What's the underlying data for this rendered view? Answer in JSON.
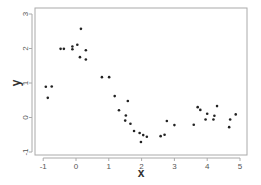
{
  "chart_data": {
    "type": "scatter",
    "title": "",
    "xlabel": "x",
    "ylabel": "y",
    "xlim": [
      -1.25,
      5.2
    ],
    "ylim": [
      -1.1,
      3.15
    ],
    "xticks": [
      -1,
      0,
      1,
      2,
      3,
      4,
      5
    ],
    "yticks": [
      -1,
      0,
      1,
      2,
      3
    ],
    "grid": false,
    "legend": null,
    "point_color": "#222222",
    "axis_color": "#aaaaaa",
    "series": [
      {
        "name": "points",
        "x": [
          -0.92,
          -0.74,
          -0.86,
          -0.47,
          -0.37,
          -0.11,
          -0.11,
          0.04,
          0.15,
          0.12,
          0.3,
          0.3,
          0.79,
          1.01,
          1.18,
          1.58,
          1.31,
          1.52,
          1.5,
          1.66,
          1.77,
          1.94,
          2.05,
          2.16,
          1.98,
          2.58,
          2.7,
          2.77,
          3.0,
          3.59,
          3.71,
          3.79,
          3.95,
          4.0,
          4.19,
          4.22,
          4.3,
          4.67,
          4.7,
          4.87
        ],
        "y": [
          0.89,
          0.9,
          0.57,
          1.99,
          1.99,
          2.06,
          1.98,
          2.11,
          2.57,
          1.75,
          1.95,
          1.68,
          1.17,
          1.17,
          0.62,
          0.48,
          0.21,
          0.06,
          -0.09,
          -0.18,
          -0.39,
          -0.45,
          -0.51,
          -0.56,
          -0.71,
          -0.54,
          -0.5,
          -0.1,
          -0.22,
          -0.21,
          0.3,
          0.22,
          -0.06,
          0.11,
          -0.06,
          0.05,
          0.33,
          -0.28,
          -0.06,
          0.09
        ]
      }
    ]
  }
}
